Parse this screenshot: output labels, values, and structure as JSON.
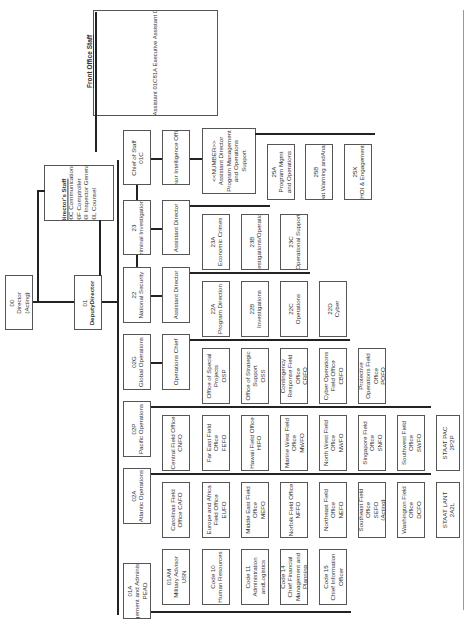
{
  "front_office_staff": {
    "title": "Front Office Staff",
    "items": [
      "01CK Senior Strategy Planner/Advisor",
      "01C4 NCIS Representative to USMC",
      "01C4 NCIS Representative to SOCM/CND",
      "01C80 Executive Assistant",
      "01C81 Executive Assistant",
      "01C81A Executive Assistant",
      "01CW Executive Writer Editor",
      "01CC Lead Staff Assistant",
      "01CC1 Executive Staff Assistant",
      "01CC2 Executive Staff Assistant",
      "01CC3 Executive Staff Assistant Pentagon"
    ]
  },
  "directors_staff": {
    "title": "Director's Staff",
    "items": [
      "00C Communications",
      "00F Comptroller",
      "00I Inspector General",
      "00L Counsel"
    ]
  },
  "director": {
    "code": "00",
    "title": "Director",
    "note": "(Acting)"
  },
  "deputy_director": {
    "code": "01",
    "title": "DeputyDirector"
  },
  "directorates": [
    {
      "code": "01C",
      "title": "Chief of Staff"
    },
    {
      "code": "23",
      "title": "Criminal Investigations"
    },
    {
      "code": "22",
      "title": "National Security"
    },
    {
      "code": "02G",
      "title": "Global Operations"
    },
    {
      "code": "02P",
      "title": "Pacific Operations"
    },
    {
      "code": "02A",
      "title": "Atlantic Operations"
    },
    {
      "code": "01A",
      "title": "Management and Administration",
      "sub": "PEAD"
    }
  ],
  "chief_of_staff_branch": {
    "senior_intel": "Senior Intelligence Officer",
    "asst_director": {
      "l1": "<<NUMBER>>",
      "l2": "Assistant Director",
      "l3": "Program Management",
      "l4": "and Operations",
      "l5": "Support"
    },
    "units": [
      {
        "code": "25A",
        "title": "Program Management and Operations"
      },
      {
        "code": "25B",
        "title": "Threat Warning andAnalysis"
      },
      {
        "code": "25X",
        "title": "HOI & Engagement"
      }
    ]
  },
  "criminal_branch": {
    "head": "Assistant Director",
    "units": [
      {
        "code": "23A",
        "title": "Economic Crimes"
      },
      {
        "code": "23B",
        "title": "Investigations/Operations"
      },
      {
        "code": "23C",
        "title": "Operational Support"
      }
    ]
  },
  "natsec_branch": {
    "head": "Assistant Director",
    "units": [
      {
        "code": "22A",
        "title": "Program Direction"
      },
      {
        "code": "22B",
        "title": "Investigations"
      },
      {
        "code": "22C",
        "title": "Operations"
      },
      {
        "code": "22D",
        "title": "Cyber"
      }
    ]
  },
  "global_branch": {
    "head": "Operations Chief",
    "units": [
      {
        "title": "Office of Special Projects",
        "code": "OSP"
      },
      {
        "title": "Office of Strategic Support",
        "code": "OSS"
      },
      {
        "title": "Contingency Response Field Office",
        "code": "CRFO"
      },
      {
        "title": "Cyber Operations Field Office",
        "code": "CBFO"
      },
      {
        "title": "Protective Operations Field Office",
        "code": "POFO"
      }
    ]
  },
  "pacific_branch": {
    "units": [
      {
        "title": "Central Field Office",
        "code": "CNFO"
      },
      {
        "title": "Far East Field Office",
        "code": "FEFO"
      },
      {
        "title": "Hawaii Field Office",
        "code": "HIFO"
      },
      {
        "title": "Marine West Field Office",
        "code": "MWFO"
      },
      {
        "title": "North West Field Office",
        "code": "NWFO"
      },
      {
        "title": "Singapore Field Office",
        "code": "SNFO"
      },
      {
        "title": "Southwest Field Office",
        "code": "SWFO"
      },
      {
        "title": "STAAT PAC",
        "code": "2P2P"
      }
    ]
  },
  "atlantic_branch": {
    "units": [
      {
        "title": "Carolinas Field Office",
        "code": "CAFO"
      },
      {
        "title": "Europe and Africa Field Office",
        "code": "EUFO"
      },
      {
        "title": "Middle East Field Office",
        "code": "MEFO"
      },
      {
        "title": "Norfolk Field Office",
        "code": "NFFO"
      },
      {
        "title": "Northeast Field Office",
        "code": "NEFO"
      },
      {
        "title": "Southeast Field Office",
        "code": "SEFO",
        "note": "(Acting)"
      },
      {
        "title": "Washington Field Office",
        "code": "DCFO"
      },
      {
        "title": "STAAT LANT",
        "code": "2A2L"
      }
    ]
  },
  "mgmt_branch": {
    "units": [
      {
        "code": "01AM",
        "title": "Military Advisor",
        "sub": "USN"
      },
      {
        "code": "Code 10",
        "title": "Human Resources"
      },
      {
        "code": "Code 11",
        "title": "Administration andLogistics"
      },
      {
        "code": "Code 14",
        "title": "Chief Financial Management and Planning"
      },
      {
        "code": "Code 15",
        "title": "Chief Information Officer"
      }
    ]
  }
}
